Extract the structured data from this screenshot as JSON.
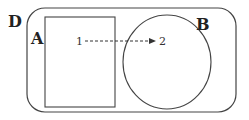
{
  "diagram": {
    "regions": [
      {
        "id": "D",
        "label": "D",
        "shape": "rounded-rectangle"
      },
      {
        "id": "A",
        "label": "A",
        "shape": "rectangle"
      },
      {
        "id": "B",
        "label": "B",
        "shape": "ellipse"
      }
    ],
    "points": [
      {
        "id": "1",
        "label": "1"
      },
      {
        "id": "2",
        "label": "2"
      }
    ],
    "arrow": {
      "from": "1",
      "to": "2",
      "style": "dashed"
    },
    "colors": {
      "stroke": "#444444",
      "text": "#222222",
      "background": "#ffffff"
    }
  }
}
